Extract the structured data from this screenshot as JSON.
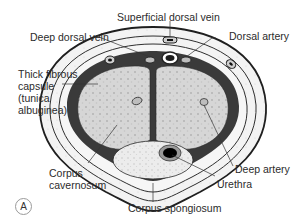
{
  "figure": {
    "panel_label": "A",
    "colors": {
      "skin_outline": "#1f1f1f",
      "fascia_fill": "#f2f2f2",
      "tunica_dark": "#3a3a3a",
      "erectile_tissue": "#d9d9d9",
      "spongiosum_tissue": "#eeeeee",
      "urethra_lumen": "#000000"
    }
  },
  "labels": {
    "superficial_dorsal_vein": "Superficial dorsal vein",
    "deep_dorsal_vein": "Deep dorsal vein",
    "dorsal_artery": "Dorsal artery",
    "tunica": "Thick fibrous capsule (tunica albuginea)",
    "tunica_line1": "Thick fibrous",
    "tunica_line2": "capsule",
    "tunica_line3": "(tunica",
    "tunica_line4": "albuginea)",
    "corpus_cavernosum_line1": "Corpus",
    "corpus_cavernosum_line2": "cavernosum",
    "deep_artery": "Deep artery",
    "urethra": "Urethra",
    "corpus_spongiosum": "Corpus spongiosum"
  }
}
